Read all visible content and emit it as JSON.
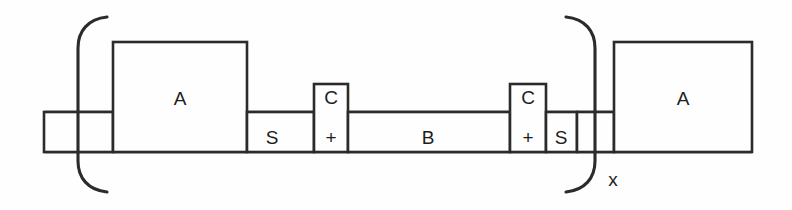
{
  "figure": {
    "type": "block-copolymer-schematic",
    "background_color": "#fefefe",
    "stroke_color": "#2b2b2b",
    "canvas": {
      "width": 792,
      "height": 210
    }
  },
  "blocks": {
    "left_terminal": {
      "label": "",
      "x": 44,
      "y": 112,
      "width": 69,
      "height": 40
    },
    "left_a_block": {
      "label": "A",
      "x": 113,
      "y": 42,
      "width": 134,
      "height": 110,
      "label_x": 180,
      "label_y": 100
    },
    "left_s_segment": {
      "label": "S",
      "x": 247,
      "y": 112,
      "width": 67,
      "height": 40,
      "label_x": 272,
      "label_y": 138
    },
    "left_c_block": {
      "label": "C",
      "charge": "+",
      "x": 314,
      "y": 84,
      "width": 34,
      "height": 68,
      "label_x": 331,
      "label_y": 98,
      "charge_x": 331,
      "charge_y": 138
    },
    "b_segment": {
      "label": "B",
      "x": 348,
      "y": 112,
      "width": 162,
      "height": 40,
      "label_x": 428,
      "label_y": 138
    },
    "right_c_block": {
      "label": "C",
      "charge": "+",
      "x": 510,
      "y": 84,
      "width": 36,
      "height": 68,
      "label_x": 528,
      "label_y": 98,
      "charge_x": 528,
      "charge_y": 138
    },
    "right_s_segment": {
      "label": "S",
      "x": 546,
      "y": 112,
      "width": 31,
      "height": 40,
      "label_x": 561,
      "label_y": 138
    },
    "right_terminal": {
      "label": "",
      "x": 577,
      "y": 112,
      "width": 37,
      "height": 40
    },
    "right_a_block": {
      "label": "A",
      "x": 614,
      "y": 42,
      "width": 138,
      "height": 110,
      "label_x": 683,
      "label_y": 100
    }
  },
  "brackets": {
    "left": {
      "name": "left-repeat-bracket",
      "x": 78,
      "top_y": 15,
      "bottom_y": 193
    },
    "right": {
      "name": "right-repeat-bracket",
      "x": 595,
      "top_y": 15,
      "bottom_y": 193,
      "subscript": "x",
      "subscript_x": 612,
      "subscript_y": 180
    }
  },
  "backbone": {
    "top_line_y": 112,
    "bottom_line_y": 152,
    "start_x": 44,
    "end_x": 752
  },
  "legend_text": {
    "repeat_subscript": "x",
    "unit_a": "A",
    "unit_b": "B",
    "unit_s": "S",
    "unit_c": "C",
    "charge_sign": "+"
  }
}
